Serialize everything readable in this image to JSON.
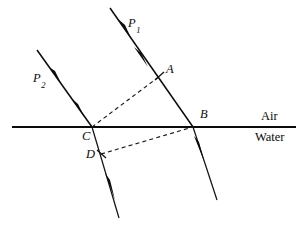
{
  "figure": {
    "width": 305,
    "height": 228,
    "background_color": "#ffffff",
    "ink_color": "#0b0b0b"
  },
  "labels": {
    "ray_p1_main": "P",
    "ray_p1_sub": "1",
    "ray_p2_main": "P",
    "ray_p2_sub": "2",
    "point_a": "A",
    "point_b": "B",
    "point_c": "C",
    "point_d": "D"
  },
  "media": {
    "upper": "Air",
    "lower": "Water"
  },
  "geometry": {
    "interface": {
      "x1": 12,
      "y1": 127,
      "x2": 296,
      "y2": 127
    },
    "rays": [
      {
        "name": "incident-ray-p1",
        "x1": 110,
        "y1": 8,
        "x2": 193,
        "y2": 127,
        "arrows": [
          {
            "x": 124,
            "y": 28
          },
          {
            "x": 141,
            "y": 57
          }
        ]
      },
      {
        "name": "incident-ray-p2",
        "x1": 37,
        "y1": 50,
        "x2": 92,
        "y2": 127,
        "arrows": [
          {
            "x": 54,
            "y": 74
          },
          {
            "x": 78,
            "y": 108
          }
        ]
      },
      {
        "name": "refracted-ray-from-c",
        "x1": 92,
        "y1": 127,
        "x2": 119,
        "y2": 218,
        "arrows": [
          {
            "x": 110,
            "y": 187
          }
        ]
      },
      {
        "name": "refracted-ray-from-b",
        "x1": 193,
        "y1": 127,
        "x2": 217,
        "y2": 200,
        "arrows": [
          {
            "x": 200,
            "y": 150
          }
        ]
      }
    ],
    "wavefronts": [
      {
        "name": "wavefront-a-c",
        "x1": 92,
        "y1": 127,
        "x2": 160,
        "y2": 76
      },
      {
        "name": "wavefront-d-b",
        "x1": 101,
        "y1": 154,
        "x2": 193,
        "y2": 127
      }
    ],
    "label_positions": {
      "p1": {
        "left": 128,
        "top": 17
      },
      "p2": {
        "left": 33,
        "top": 72
      },
      "a": {
        "left": 166,
        "top": 63
      },
      "b": {
        "left": 200,
        "top": 108
      },
      "c": {
        "left": 82,
        "top": 130
      },
      "d": {
        "left": 86,
        "top": 148
      },
      "air": {
        "left": 261,
        "top": 110
      },
      "water": {
        "left": 255,
        "top": 130
      }
    }
  }
}
